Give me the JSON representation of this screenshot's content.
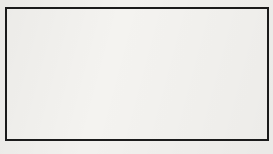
{
  "figure": {
    "board": {
      "origin_x": 5.5,
      "origin_y": 8.0,
      "spacing": 14.8,
      "cols": 19,
      "rows": 10,
      "line_color": "#4a4a4a",
      "border_color": "#1b1b1b",
      "background_color": "#f4f3f0"
    },
    "star_points": [
      {
        "col": 3,
        "row": 9
      },
      {
        "col": 9,
        "row": 3
      },
      {
        "col": 9,
        "row": 9
      },
      {
        "col": 15,
        "row": 9
      }
    ],
    "stones": [
      {
        "col": 4,
        "row": 0,
        "color": "black",
        "label": ""
      },
      {
        "col": 5,
        "row": 0,
        "color": "black",
        "label": ""
      },
      {
        "col": 2,
        "row": 1,
        "color": "white",
        "label": ""
      },
      {
        "col": 4,
        "row": 1,
        "color": "white",
        "label": ""
      },
      {
        "col": 5,
        "row": 1,
        "color": "black",
        "label": ""
      },
      {
        "col": 8,
        "row": 1,
        "color": "white",
        "label": ""
      },
      {
        "col": 10,
        "row": 1,
        "color": "white",
        "label": ""
      },
      {
        "col": 12,
        "row": 1,
        "color": "black",
        "label": ""
      },
      {
        "col": 13,
        "row": 1,
        "color": "white",
        "label": "1"
      },
      {
        "col": 15,
        "row": 1,
        "color": "black",
        "label": ""
      },
      {
        "col": 3,
        "row": 2,
        "color": "white",
        "label": ""
      },
      {
        "col": 4,
        "row": 2,
        "color": "black",
        "label": ""
      },
      {
        "col": 5,
        "row": 2,
        "color": "black",
        "label": ""
      },
      {
        "col": 11,
        "row": 2,
        "color": "white",
        "label": ""
      },
      {
        "col": 12,
        "row": 2,
        "color": "black",
        "label": "2"
      },
      {
        "col": 16,
        "row": 2,
        "color": "black",
        "label": ""
      },
      {
        "col": 4,
        "row": 3,
        "color": "white",
        "label": ""
      },
      {
        "col": 5,
        "row": 3,
        "color": "black",
        "label": ""
      },
      {
        "col": 7,
        "row": 3,
        "color": "black",
        "label": ""
      },
      {
        "col": 9,
        "row": 3,
        "color": "black",
        "label": ""
      },
      {
        "col": 10,
        "row": 3,
        "color": "white",
        "label": "3"
      },
      {
        "col": 11,
        "row": 3,
        "color": "white",
        "label": "5"
      },
      {
        "col": 2,
        "row": 4,
        "color": "white",
        "label": ""
      },
      {
        "col": 4,
        "row": 4,
        "color": "white",
        "label": ""
      },
      {
        "col": 5,
        "row": 4,
        "color": "black",
        "label": ""
      },
      {
        "col": 10,
        "row": 4,
        "color": "black",
        "label": "4"
      },
      {
        "col": 11,
        "row": 4,
        "color": "black",
        "label": ""
      },
      {
        "col": 15,
        "row": 4,
        "color": "black",
        "label": ""
      },
      {
        "col": 16,
        "row": 4,
        "color": "white",
        "label": ""
      },
      {
        "col": 4,
        "row": 5,
        "color": "white",
        "label": ""
      },
      {
        "col": 16,
        "row": 5,
        "color": "white",
        "label": ""
      },
      {
        "col": 16,
        "row": 7,
        "color": "white",
        "label": ""
      }
    ],
    "move_sequence": [
      {
        "number": "1",
        "color": "white"
      },
      {
        "number": "2",
        "color": "black"
      },
      {
        "number": "3",
        "color": "white"
      },
      {
        "number": "4",
        "color": "black"
      },
      {
        "number": "5",
        "color": "white"
      }
    ]
  }
}
